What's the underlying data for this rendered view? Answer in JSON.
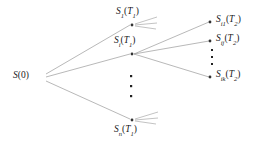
{
  "figure": {
    "type": "scenario-tree-diagram",
    "background": "#ffffff",
    "line_color": "#9a9a9a",
    "node_color": "#333333",
    "text_color": "#1a1a1a"
  },
  "nodes": {
    "root": {
      "id": "S0",
      "label_main": "S",
      "label_sub": "",
      "label_arg": "(0)",
      "text": "S(0)",
      "x": 27,
      "y": 77
    },
    "stage1": [
      {
        "id": "S1T1",
        "label_main": "S",
        "label_sub": "1",
        "label_arg": "(T",
        "label_arg_sub": "1",
        "label_arg_end": ")",
        "text": "S1(T1)",
        "x": 133,
        "y": 22
      },
      {
        "id": "SiT1",
        "label_main": "S",
        "label_sub": "i",
        "label_arg": "(T",
        "label_arg_sub": "1",
        "label_arg_end": ")",
        "text": "Si(T1)",
        "x": 133,
        "y": 51
      },
      {
        "id": "SnT1",
        "label_main": "S",
        "label_sub": "n",
        "label_arg": "(T",
        "label_arg_sub": "1",
        "label_arg_end": ")",
        "text": "Sn(T1)",
        "x": 133,
        "y": 122
      }
    ],
    "stage2": [
      {
        "id": "Si1T2",
        "label_main": "S",
        "label_sub": "i1",
        "label_arg": "(T",
        "label_arg_sub": "2",
        "label_arg_end": ")",
        "text": "Si1(T2)",
        "x": 213,
        "y": 21
      },
      {
        "id": "SijT2",
        "label_main": "S",
        "label_sub": "ij",
        "label_arg": "(T",
        "label_arg_sub": "2",
        "label_arg_end": ")",
        "text": "Sij(T2)",
        "x": 213,
        "y": 40
      },
      {
        "id": "SikT2",
        "label_main": "S",
        "label_sub": "ik",
        "label_arg": "(T",
        "label_arg_sub": "2",
        "label_arg_end": ")",
        "text": "Sik(T2)",
        "x": 213,
        "y": 76
      }
    ]
  },
  "ellipses": [
    {
      "id": "stage1-ellipsis",
      "orientation": "vertical",
      "count": 3,
      "x": 131,
      "y_start": 76,
      "y_step": 10
    },
    {
      "id": "stage2-ellipsis",
      "orientation": "vertical",
      "count": 3,
      "x": 212,
      "y_start": 50,
      "y_step": 7
    }
  ],
  "edges": [
    {
      "from": "S0",
      "to": "S1T1"
    },
    {
      "from": "S0",
      "to": "SiT1"
    },
    {
      "from": "S0",
      "to": "SnT1"
    },
    {
      "from": "SiT1",
      "to": "Si1T2"
    },
    {
      "from": "SiT1",
      "to": "SijT2"
    },
    {
      "from": "SiT1",
      "to": "SikT2"
    }
  ],
  "stub_edges": [
    {
      "from": "S1T1",
      "note": "truncated-branch-fan"
    },
    {
      "from": "SnT1",
      "note": "truncated-branch-fan"
    }
  ]
}
